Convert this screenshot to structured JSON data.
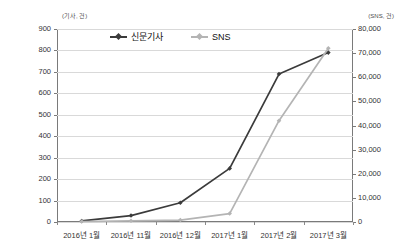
{
  "axis_units": {
    "left": "(기사, 건)",
    "right": "(SNS, 건)"
  },
  "legend": {
    "items": [
      {
        "label": "신문기사",
        "color": "#3b3b3b",
        "marker": "diamond-marker"
      },
      {
        "label": "SNS",
        "color": "#b4b4b4",
        "marker": "diamond-marker"
      }
    ]
  },
  "left_axis": {
    "ticks": [
      "0",
      "100",
      "200",
      "300",
      "400",
      "500",
      "600",
      "700",
      "800",
      "900"
    ]
  },
  "right_axis": {
    "ticks": [
      "0",
      "10,000",
      "20,000",
      "30,000",
      "40,000",
      "50,000",
      "60,000",
      "70,000",
      "80,000"
    ]
  },
  "x_axis": {
    "ticks": [
      "2016년 1월",
      "2016년 11월",
      "2016년 12월",
      "2017년 1월",
      "2017년 2월",
      "2017년 3월"
    ]
  },
  "chart_data": {
    "type": "line",
    "title": "",
    "subtitle": "",
    "xlabel": "",
    "ylabel": "(기사, 건)",
    "y2label": "(SNS, 건)",
    "grid": true,
    "legend_position": "top-center",
    "categories": [
      "2016년 1월",
      "2016년 11월",
      "2016년 12월",
      "2017년 1월",
      "2017년 2월",
      "2017년 3월"
    ],
    "ylim": [
      0,
      900
    ],
    "y2lim": [
      0,
      80000
    ],
    "yticks": [
      0,
      100,
      200,
      300,
      400,
      500,
      600,
      700,
      800,
      900
    ],
    "y2ticks": [
      0,
      10000,
      20000,
      30000,
      40000,
      50000,
      60000,
      70000,
      80000
    ],
    "series": [
      {
        "name": "신문기사",
        "axis": "left",
        "color": "#3b3b3b",
        "marker": "diamond",
        "values": [
          5,
          30,
          90,
          250,
          690,
          790
        ]
      },
      {
        "name": "SNS",
        "axis": "right",
        "color": "#b4b4b4",
        "marker": "diamond",
        "values": [
          200,
          500,
          800,
          3500,
          42000,
          72000
        ]
      }
    ]
  }
}
